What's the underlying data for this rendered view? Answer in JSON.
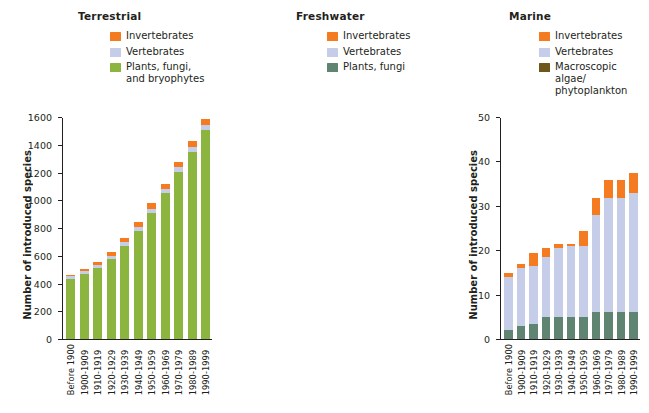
{
  "figure": {
    "ylabel": "Number of introduced species",
    "categories": [
      "Before 1900",
      "1900-1909",
      "1910-1919",
      "1920-1929",
      "1930-1939",
      "1940-1949",
      "1950-1959",
      "1960-1969",
      "1970-1979",
      "1980-1989",
      "1990-1999"
    ]
  },
  "colors": {
    "invertebrates": "#F47B20",
    "vertebrates": "#C5CDE8",
    "plants_terrestrial": "#8CB53F",
    "plants_freshwater": "#5F8472",
    "algae_marine": "#6E5518",
    "axis": "#231f20",
    "text": "#231f20"
  },
  "panels": [
    {
      "title": "Terrestrial",
      "legend": [
        {
          "label": "Invertebrates",
          "color": "#F47B20",
          "key": "invertebrates"
        },
        {
          "label": "Vertebrates",
          "color": "#C5CDE8",
          "key": "vertebrates"
        },
        {
          "label": "Plants, fungi,\nand bryophytes",
          "color": "#8CB53F",
          "key": "plants"
        }
      ],
      "ylim": [
        0,
        1600
      ],
      "yticks": [
        0,
        200,
        400,
        600,
        800,
        1000,
        1200,
        1400,
        1600
      ],
      "chart_data": {
        "type": "bar",
        "stacked": true,
        "title": "Terrestrial",
        "xlabel": "",
        "ylabel": "Number of introduced species",
        "ylim": [
          0,
          1600
        ],
        "grid": false,
        "legend_position": "top-right",
        "categories": [
          "Before 1900",
          "1900-1909",
          "1910-1919",
          "1920-1929",
          "1930-1939",
          "1940-1949",
          "1950-1959",
          "1960-1969",
          "1970-1979",
          "1980-1989",
          "1990-1999"
        ],
        "series": [
          {
            "name": "Plants, fungi, and bryophytes",
            "color": "#8CB53F",
            "values": [
              435,
              470,
              515,
              580,
              675,
              780,
              910,
              1055,
              1210,
              1355,
              1510
            ]
          },
          {
            "name": "Vertebrates",
            "color": "#C5CDE8",
            "values": [
              18,
              20,
              22,
              24,
              26,
              28,
              30,
              32,
              34,
              36,
              38
            ]
          },
          {
            "name": "Invertebrates",
            "color": "#F47B20",
            "values": [
              14,
              20,
              22,
              27,
              30,
              37,
              42,
              35,
              40,
              45,
              45
            ]
          }
        ],
        "totals": [
          467,
          510,
          559,
          631,
          731,
          845,
          982,
          1122,
          1284,
          1436,
          1593
        ]
      }
    },
    {
      "title": "Freshwater",
      "legend": [
        {
          "label": "Invertebrates",
          "color": "#F47B20",
          "key": "invertebrates"
        },
        {
          "label": "Vertebrates",
          "color": "#C5CDE8",
          "key": "vertebrates"
        },
        {
          "label": "Plants, fungi",
          "color": "#5F8472",
          "key": "plants"
        }
      ],
      "ylim": [
        0,
        50
      ],
      "yticks": [
        0,
        10,
        20,
        30,
        40,
        50
      ],
      "chart_data": {
        "type": "bar",
        "stacked": true,
        "title": "Freshwater",
        "xlabel": "",
        "ylabel": "Number of introduced species",
        "ylim": [
          0,
          50
        ],
        "grid": false,
        "legend_position": "top-right",
        "categories": [
          "Before 1900",
          "1900-1909",
          "1910-1919",
          "1920-1929",
          "1930-1939",
          "1940-1949",
          "1950-1959",
          "1960-1969",
          "1970-1979",
          "1980-1989",
          "1990-1999"
        ],
        "series": [
          {
            "name": "Plants, fungi",
            "color": "#5F8472",
            "values": [
              2,
              3,
              3.5,
              5,
              5,
              5,
              5,
              6,
              6,
              6,
              6
            ]
          },
          {
            "name": "Vertebrates",
            "color": "#C5CDE8",
            "values": [
              12,
              13,
              13,
              13.5,
              15.5,
              16,
              16,
              22,
              26,
              26,
              27
            ]
          },
          {
            "name": "Invertebrates",
            "color": "#F47B20",
            "values": [
              1,
              1,
              3,
              2,
              1,
              0.5,
              3.5,
              4,
              4,
              4,
              4.5
            ]
          }
        ],
        "totals": [
          15,
          17,
          19.5,
          20.5,
          21.5,
          21.5,
          24.5,
          32,
          36,
          36,
          37.5
        ]
      }
    },
    {
      "title": "Marine",
      "legend": [
        {
          "label": "Invertebrates",
          "color": "#F47B20",
          "key": "invertebrates"
        },
        {
          "label": "Vertebrates",
          "color": "#C5CDE8",
          "key": "vertebrates"
        },
        {
          "label": "Macroscopic algae/\nphytoplankton",
          "color": "#6E5518",
          "key": "algae"
        }
      ],
      "ylim": [
        0,
        60
      ],
      "yticks": [
        0,
        10,
        20,
        30,
        40,
        50,
        60
      ],
      "chart_data": {
        "type": "bar",
        "stacked": true,
        "title": "Marine",
        "xlabel": "",
        "ylabel": "Number of introduced species",
        "ylim": [
          0,
          60
        ],
        "grid": false,
        "legend_position": "top-right",
        "categories": [
          "Before 1900",
          "1900-1909",
          "1910-1919",
          "1920-1929",
          "1930-1939",
          "1940-1949",
          "1950-1959",
          "1960-1969",
          "1970-1979",
          "1980-1989",
          "1990-1999"
        ],
        "series": [
          {
            "name": "Macroscopic algae/phytoplankton",
            "color": "#6E5518",
            "values": [
              3,
              5,
              6,
              7.5,
              8,
              7.8,
              7.8,
              11,
              14.5,
              16,
              18
            ]
          },
          {
            "name": "Vertebrates",
            "color": "#C5CDE8",
            "values": [
              0,
              0,
              0,
              0,
              0.6,
              0.8,
              0.8,
              1.5,
              4,
              7.5,
              8
            ]
          },
          {
            "name": "Invertebrates",
            "color": "#F47B20",
            "values": [
              4.5,
              7.5,
              7.8,
              11.3,
              13,
              14.5,
              17,
              19.3,
              22,
              23,
              26.5
            ]
          }
        ],
        "totals": [
          7.5,
          12.5,
          13.8,
          18.8,
          21.6,
          23.1,
          25.6,
          31.8,
          40.5,
          46.5,
          52.5
        ]
      }
    }
  ]
}
